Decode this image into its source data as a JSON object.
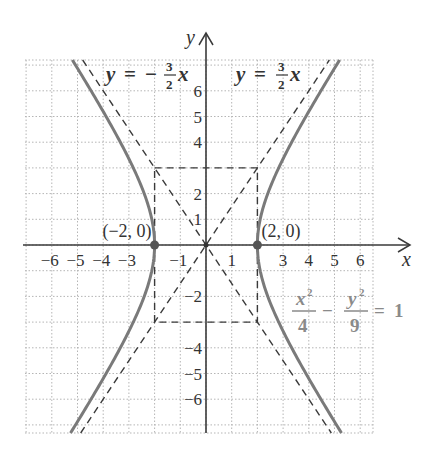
{
  "figure": {
    "axis_labels": {
      "x": "x",
      "y": "y"
    },
    "x_ticks": [
      {
        "value": -6,
        "label": "−6"
      },
      {
        "value": -5,
        "label": "−5"
      },
      {
        "value": -4,
        "label": "−4"
      },
      {
        "value": -3,
        "label": "−3"
      },
      {
        "value": -1,
        "label": "−1"
      },
      {
        "value": 1,
        "label": "1"
      },
      {
        "value": 3,
        "label": "3"
      },
      {
        "value": 4,
        "label": "4"
      },
      {
        "value": 5,
        "label": "5"
      },
      {
        "value": 6,
        "label": "6"
      }
    ],
    "y_ticks": [
      {
        "value": 6,
        "label": "6"
      },
      {
        "value": 5,
        "label": "5"
      },
      {
        "value": 4,
        "label": "4"
      },
      {
        "value": 2,
        "label": "2"
      },
      {
        "value": 1,
        "label": "1"
      },
      {
        "value": -2,
        "label": "−2"
      },
      {
        "value": -4,
        "label": "−4"
      },
      {
        "value": -5,
        "label": "−5"
      },
      {
        "value": -6,
        "label": "−6"
      }
    ],
    "vertices": [
      {
        "label": "(−2, 0)",
        "x": -2,
        "y": 0
      },
      {
        "label": "(2, 0)",
        "x": 2,
        "y": 0
      }
    ],
    "asymptotes": [
      {
        "lhs": "y",
        "eq": "=",
        "sign": "−",
        "num": "3",
        "den": "2",
        "var": "x",
        "slope": -1.5
      },
      {
        "lhs": "y",
        "eq": "=",
        "sign": "",
        "num": "3",
        "den": "2",
        "var": "x",
        "slope": 1.5
      }
    ],
    "equation": {
      "term1_num": "x",
      "term1_exp": "2",
      "term1_den": "4",
      "minus": "−",
      "term2_num": "y",
      "term2_exp": "2",
      "term2_den": "9",
      "eq": "=",
      "rhs": "1"
    },
    "hyperbola": {
      "a": 2,
      "b": 3,
      "orientation": "horizontal"
    },
    "central_box": {
      "x_min": -2,
      "x_max": 2,
      "y_min": -3,
      "y_max": 3
    },
    "colors": {
      "axis": "#3a3a3a",
      "curve": "#7a7a7a",
      "dashed": "#3a3a3a",
      "grid": "#b5b5b5",
      "equation": "#8a8a8a"
    }
  }
}
